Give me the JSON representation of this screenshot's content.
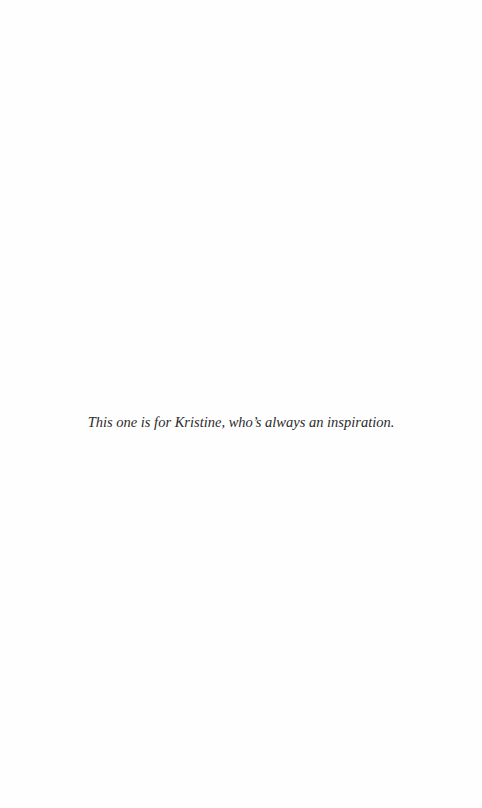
{
  "page": {
    "type": "dedication",
    "dedication_text": "This one is for Kristine, who’s always an inspiration."
  }
}
